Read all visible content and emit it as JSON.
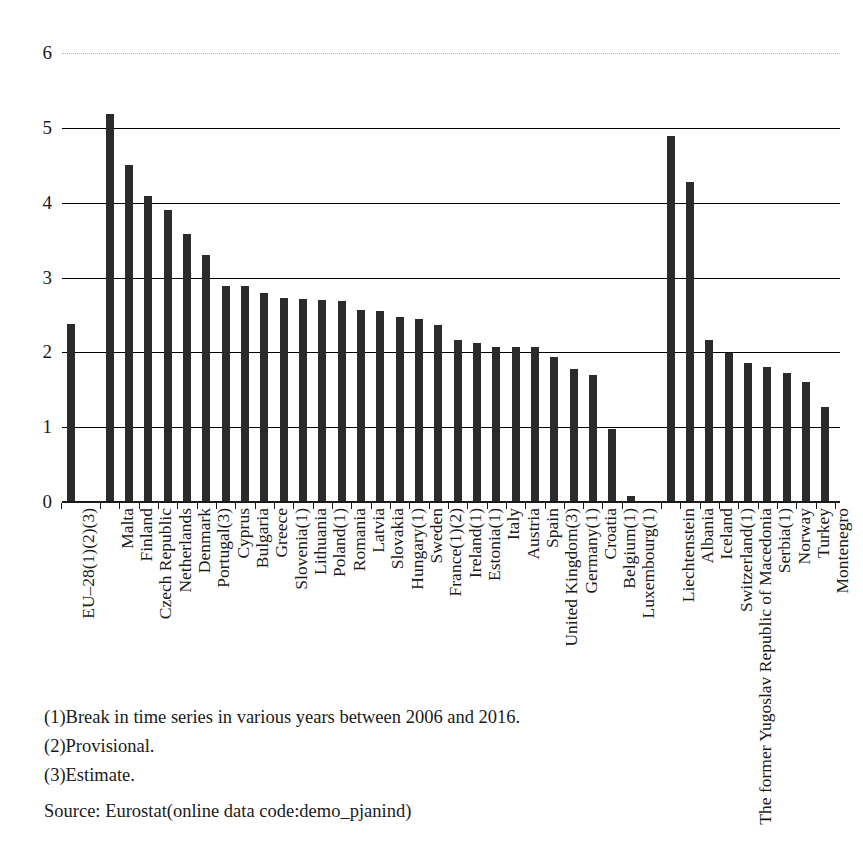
{
  "chart_data": {
    "type": "bar",
    "title": "",
    "subtitle": "",
    "xlabel": "",
    "ylabel": "",
    "ylim": [
      0,
      6
    ],
    "yticks": [
      0,
      1,
      2,
      3,
      4,
      5,
      6
    ],
    "ytick_labels": [
      "0",
      "1",
      "2",
      "3",
      "4",
      "5",
      "6"
    ],
    "grid": true,
    "legend": null,
    "orientation": "vertical",
    "bar_color": "#2b2b2b",
    "categories": [
      "EU–28(1)(2)(3)",
      "Malta",
      "Finland",
      "Czech Republic",
      "Netherlands",
      "Denmark",
      "Portugal(3)",
      "Cyprus",
      "Bulgaria",
      "Greece",
      "Slovenia(1)",
      "Lithuania",
      "Poland(1)",
      "Romania",
      "Latvia",
      "Slovakia",
      "Hungary(1)",
      "Sweden",
      "France(1)(2)",
      "Ireland(1)",
      "Estonia(1)",
      "Italy",
      "Austria",
      "Spain",
      "United Kingdom(3)",
      "Germany(1)",
      "Croatia",
      "Belgium(1)",
      "Luxembourg(1)",
      "Liechtenstein",
      "Albania",
      "Iceland",
      "Switzerland(1)",
      "The former Yugoslav Republic of Macedonia",
      "Serbia(1)",
      "Norway",
      "Turkey",
      "Montenegro"
    ],
    "values": [
      2.38,
      5.19,
      4.5,
      4.09,
      3.9,
      3.58,
      3.3,
      2.89,
      2.88,
      2.79,
      2.73,
      2.71,
      2.7,
      2.69,
      2.57,
      2.55,
      2.47,
      2.44,
      2.36,
      2.17,
      2.12,
      2.07,
      2.07,
      2.07,
      1.94,
      1.78,
      1.7,
      0.98,
      0.08,
      4.89,
      4.27,
      2.16,
      1.99,
      1.86,
      1.81,
      1.73,
      1.6,
      1.27
    ],
    "group_breaks": [
      29
    ],
    "notes": [
      "(1)Break in time series in various years between 2006 and 2016.",
      "(2)Provisional.",
      "(3)Estimate."
    ],
    "source": "Source: Eurostat(online data code:demo_pjanind)"
  }
}
